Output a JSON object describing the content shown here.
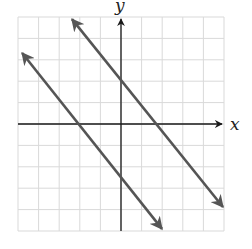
{
  "chart_data": {
    "type": "line",
    "title": "",
    "xlabel": "x",
    "ylabel": "y",
    "xlim": [
      -5,
      5
    ],
    "ylim": [
      -5,
      5
    ],
    "grid": true,
    "tick_labels": false,
    "grid_step": 1,
    "series": [
      {
        "name": "upper-line",
        "description": "line with slope about -1.2, y-intercept 2, x-intercept about 1.7",
        "points": [
          [
            -2.38,
            4.9
          ],
          [
            0,
            2
          ],
          [
            1.7,
            0
          ],
          [
            4.95,
            -3.88
          ]
        ],
        "arrows": "both"
      },
      {
        "name": "lower-line",
        "description": "parallel line with slope about -1.2, x-intercept -2, y-intercept about -2.5",
        "points": [
          [
            -4.8,
            3.32
          ],
          [
            -2.1,
            0
          ],
          [
            0,
            -2.5
          ],
          [
            1.99,
            -4.9
          ]
        ],
        "arrows": "both"
      }
    ]
  },
  "labels": {
    "x_axis": "x",
    "y_axis": "y"
  },
  "colors": {
    "grid": "#d9d9d9",
    "axes": "#1a1a1a",
    "lines": "#555555"
  }
}
